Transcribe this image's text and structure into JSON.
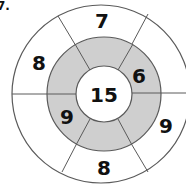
{
  "problem_label": "7.",
  "diagram": {
    "type": "number-wheel",
    "center": {
      "value": "15"
    },
    "inner_ring": {
      "fill": "#cfcfcf",
      "segments": [
        "",
        "6",
        "",
        "",
        "9",
        ""
      ]
    },
    "outer_ring": {
      "fill": "#ffffff",
      "segments": [
        "7",
        "",
        "9",
        "8",
        "",
        "8"
      ]
    },
    "visible_numbers": {
      "outer_top": "7",
      "outer_upper_left": "8",
      "outer_lower_right": "9",
      "outer_bottom": "8",
      "inner_upper_right": "6",
      "inner_lower_left": "9",
      "center": "15"
    },
    "colors": {
      "line": "#5a5a5a",
      "inner_ring_fill": "#cfcfcf",
      "text": "#111111"
    }
  }
}
